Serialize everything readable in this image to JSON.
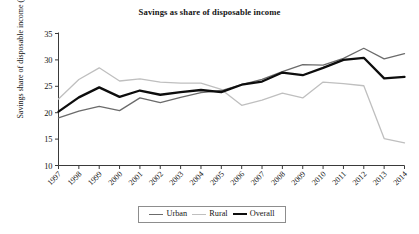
{
  "chart_data": {
    "type": "line",
    "title": "Savings as share of disposable income",
    "xlabel": "",
    "ylabel": "Savings share of disposable income (%)",
    "categories": [
      "1997",
      "1998",
      "1999",
      "2000",
      "2001",
      "2002",
      "2003",
      "2004",
      "2005",
      "2006",
      "2007",
      "2008",
      "2009",
      "2010",
      "2011",
      "2012",
      "2013",
      "2014"
    ],
    "x": [
      1997,
      1998,
      1999,
      2000,
      2001,
      2002,
      2003,
      2004,
      2005,
      2006,
      2007,
      2008,
      2009,
      2010,
      2011,
      2012,
      2013,
      2014
    ],
    "ylim": [
      10,
      35
    ],
    "yticks": [
      10,
      15,
      20,
      25,
      30,
      35
    ],
    "grid": false,
    "legend_position": "bottom",
    "series": [
      {
        "name": "Urban",
        "color": "#6b6b6b",
        "line_width": 1.3,
        "values": [
          19.0,
          20.3,
          21.2,
          20.4,
          22.8,
          21.9,
          22.9,
          23.8,
          24.2,
          25.3,
          26.3,
          27.8,
          29.1,
          29.0,
          30.3,
          32.2,
          30.2,
          31.2
        ]
      },
      {
        "name": "Rural",
        "color": "#bfbfbf",
        "line_width": 1.3,
        "values": [
          22.6,
          26.3,
          28.5,
          26.0,
          26.4,
          25.8,
          25.6,
          25.6,
          24.4,
          21.4,
          22.4,
          23.7,
          22.8,
          25.8,
          25.5,
          25.1,
          15.1,
          14.3
        ]
      },
      {
        "name": "Overall",
        "color": "#0d0d0d",
        "line_width": 2.3,
        "values": [
          20.2,
          22.9,
          24.8,
          23.0,
          24.2,
          23.4,
          23.9,
          24.3,
          23.9,
          25.3,
          25.9,
          27.6,
          27.1,
          28.5,
          30.0,
          30.4,
          26.5,
          26.8
        ]
      }
    ],
    "axis": {
      "line_color": "#3a3a3a",
      "tick_color": "#3a3a3a"
    }
  },
  "legend": {
    "items": [
      {
        "label": "Urban",
        "color": "#6b6b6b",
        "width": 1.3
      },
      {
        "label": "Rural",
        "color": "#bfbfbf",
        "width": 1.3
      },
      {
        "label": "Overall",
        "color": "#0d0d0d",
        "width": 2.3
      }
    ]
  }
}
